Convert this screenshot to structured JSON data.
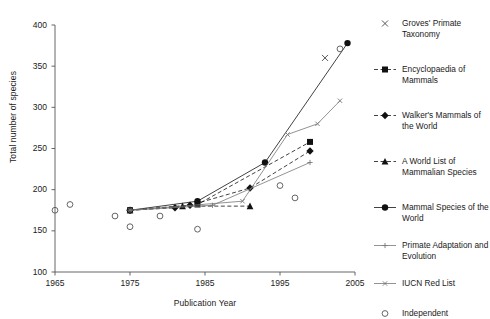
{
  "chart_data": {
    "type": "scatter",
    "title": "",
    "xlabel": "Publication Year",
    "ylabel": "Total number of species",
    "xlim": [
      1965,
      2005
    ],
    "ylim": [
      100,
      400
    ],
    "xticks": [
      1965,
      1975,
      1985,
      1995,
      2005
    ],
    "yticks": [
      100,
      150,
      200,
      250,
      300,
      350,
      400
    ],
    "grid": false,
    "legend_position": "right",
    "series": [
      {
        "name": "Groves' Primate Taxonomy",
        "marker": "cross",
        "line": "none",
        "color": "#444444",
        "points": [
          [
            2001,
            360
          ]
        ]
      },
      {
        "name": "Encyclopaedia of Mammals",
        "marker": "filled-square",
        "line": "dashed",
        "color": "#111111",
        "points": [
          [
            1975,
            175
          ],
          [
            1984,
            182
          ],
          [
            1999,
            258
          ]
        ]
      },
      {
        "name": "Walker's Mammals of the World",
        "marker": "filled-diamond",
        "line": "dashed",
        "color": "#111111",
        "points": [
          [
            1975,
            175
          ],
          [
            1981,
            178
          ],
          [
            1983,
            181
          ],
          [
            1991,
            202
          ],
          [
            1999,
            247
          ]
        ]
      },
      {
        "name": "A World List of Mammalian Species",
        "marker": "filled-triangle",
        "line": "dashed",
        "color": "#111111",
        "points": [
          [
            1975,
            175
          ],
          [
            1982,
            180
          ],
          [
            1991,
            180
          ]
        ]
      },
      {
        "name": "Mammal Species of the World",
        "marker": "filled-circle",
        "line": "solid",
        "color": "#111111",
        "points": [
          [
            1975,
            175
          ],
          [
            1984,
            186
          ],
          [
            1993,
            233
          ],
          [
            2004,
            378
          ]
        ]
      },
      {
        "name": "Primate Adaptation and Evolution",
        "marker": "plus",
        "line": "solid",
        "color": "#777777",
        "points": [
          [
            1975,
            175
          ],
          [
            1986,
            181
          ],
          [
            1999,
            233
          ]
        ]
      },
      {
        "name": "IUCN Red List",
        "marker": "small-cross",
        "line": "solid",
        "color": "#777777",
        "points": [
          [
            1975,
            175
          ],
          [
            1990,
            186
          ],
          [
            1996,
            267
          ],
          [
            2000,
            280
          ],
          [
            2003,
            308
          ]
        ]
      },
      {
        "name": "Independent",
        "marker": "open-circle",
        "line": "none",
        "color": "#555555",
        "points": [
          [
            1965,
            175
          ],
          [
            1967,
            182
          ],
          [
            1973,
            168
          ],
          [
            1975,
            155
          ],
          [
            1979,
            168
          ],
          [
            1984,
            152
          ],
          [
            1995,
            205
          ],
          [
            1997,
            190
          ],
          [
            2003,
            371
          ]
        ]
      }
    ]
  },
  "legend": {
    "entries": [
      {
        "label": "Groves' Primate Taxonomy",
        "marker": "cross-icon"
      },
      {
        "label": "Encyclopaedia of Mammals",
        "marker": "filled-square-icon"
      },
      {
        "label": "Walker's Mammals of the World",
        "marker": "filled-diamond-icon"
      },
      {
        "label": "A World List of Mammalian Species",
        "marker": "filled-triangle-icon"
      },
      {
        "label": "Mammal Species of the World",
        "marker": "filled-circle-icon"
      },
      {
        "label": "Primate Adaptation and Evolution",
        "marker": "plus-icon"
      },
      {
        "label": "IUCN Red List",
        "marker": "small-cross-icon"
      },
      {
        "label": "Independent",
        "marker": "open-circle-icon"
      }
    ]
  },
  "axis": {
    "y_tick_labels": [
      "400",
      "350",
      "300",
      "250",
      "200",
      "150",
      "100"
    ],
    "x_tick_labels": [
      "1965",
      "1975",
      "1985",
      "1995",
      "2005"
    ],
    "ylabel": "Total number of species",
    "xlabel": "Publication Year"
  }
}
